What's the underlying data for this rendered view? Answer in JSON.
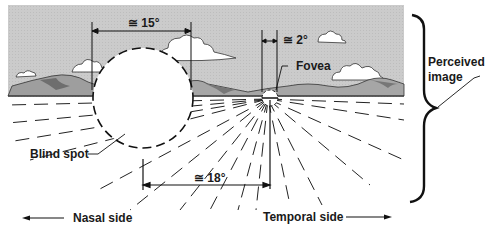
{
  "diagram": {
    "labels": {
      "angle_blind_spot_width": "≅ 15°",
      "angle_fovea_width": "≅ 2°",
      "fovea": "Fovea",
      "perceived_image_line1": "Perceived",
      "perceived_image_line2": "image",
      "blind_spot": "Blind spot",
      "angle_blind_spot_offset": "≅ 18°",
      "nasal_side": "Nasal side",
      "temporal_side": "Temporal side"
    },
    "colors": {
      "sky": "#c9c9c9",
      "mountain": "#9a9a9a",
      "mountain_dark": "#6e6e6e",
      "ink": "#1a1a1a",
      "ground": "#ffffff"
    },
    "measurements": {
      "blind_spot_angular_width_deg": 15,
      "fovea_angular_width_deg": 2,
      "blind_spot_offset_from_fovea_deg": 18
    }
  }
}
